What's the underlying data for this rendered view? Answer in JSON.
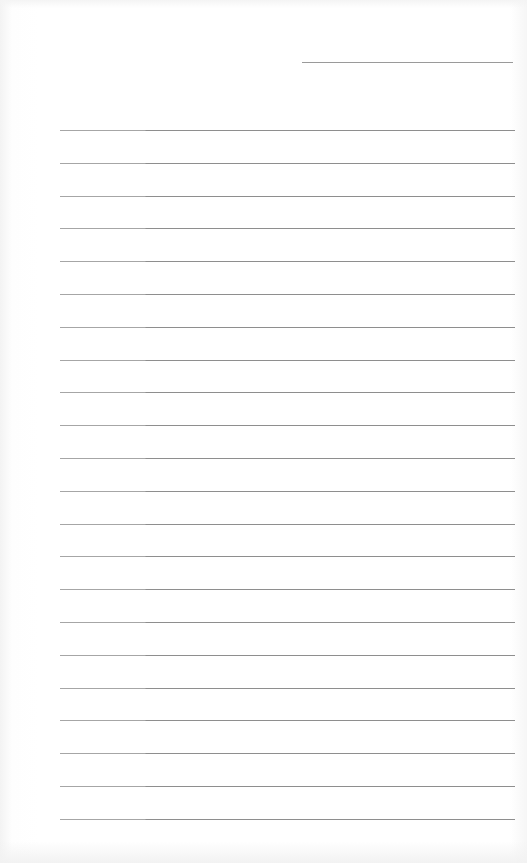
{
  "document": {
    "type": "lined-paper",
    "header_line": {
      "left": 302,
      "top": 62,
      "width": 211
    },
    "rules": {
      "count": 22,
      "first_top": 130,
      "spacing": 32.8,
      "left": 60,
      "width": 455
    },
    "colors": {
      "paper": "#ffffff",
      "rule": "#8e8e8e",
      "header_line": "#9a9a9a"
    }
  }
}
